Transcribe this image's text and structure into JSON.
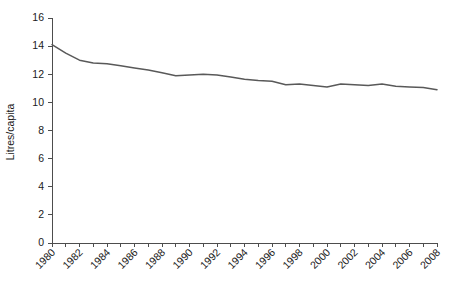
{
  "chart_data": {
    "type": "line",
    "title": "",
    "xlabel": "",
    "ylabel": "Litres/capita",
    "ylim": [
      0,
      16
    ],
    "yticks": [
      0,
      2,
      4,
      6,
      8,
      10,
      12,
      14,
      16
    ],
    "ytick_labels": [
      "0",
      "2",
      "4",
      "6",
      "8",
      "10",
      "12",
      "14",
      "16"
    ],
    "xlim": [
      1980,
      2008
    ],
    "xticks": [
      1980,
      1981,
      1982,
      1983,
      1984,
      1985,
      1986,
      1987,
      1988,
      1989,
      1990,
      1991,
      1992,
      1993,
      1994,
      1995,
      1996,
      1997,
      1998,
      1999,
      2000,
      2001,
      2002,
      2003,
      2004,
      2005,
      2006,
      2007,
      2008
    ],
    "xtick_labels": [
      "1980",
      "",
      "1982",
      "",
      "1984",
      "",
      "1986",
      "",
      "1988",
      "",
      "1990",
      "",
      "1992",
      "",
      "1994",
      "",
      "1996",
      "",
      "1998",
      "",
      "2000",
      "",
      "2002",
      "",
      "2004",
      "",
      "2006",
      "",
      "2008"
    ],
    "xtick_labels_shown": [
      "1980",
      "1982",
      "1984",
      "1986",
      "1988",
      "1990",
      "1992",
      "1994",
      "1996",
      "1998",
      "2000",
      "2002",
      "2004",
      "2006",
      "2008"
    ],
    "xtick_label_rotation": 45,
    "grid": false,
    "legend": false,
    "legend_position": "none",
    "line_color": "#595959",
    "x": [
      1980,
      1981,
      1982,
      1983,
      1984,
      1985,
      1986,
      1987,
      1988,
      1989,
      1990,
      1991,
      1992,
      1993,
      1994,
      1995,
      1996,
      1997,
      1998,
      1999,
      2000,
      2001,
      2002,
      2003,
      2004,
      2005,
      2006,
      2007,
      2008
    ],
    "values": [
      14.1,
      13.5,
      13.0,
      12.8,
      12.75,
      12.6,
      12.45,
      12.3,
      12.1,
      11.9,
      11.95,
      12.0,
      11.95,
      11.8,
      11.65,
      11.55,
      11.5,
      11.25,
      11.3,
      11.2,
      11.1,
      11.3,
      11.25,
      11.2,
      11.3,
      11.15,
      11.1,
      11.05,
      10.9
    ],
    "series": [
      {
        "name": "Litres/capita",
        "values": [
          14.1,
          13.5,
          13.0,
          12.8,
          12.75,
          12.6,
          12.45,
          12.3,
          12.1,
          11.9,
          11.95,
          12.0,
          11.95,
          11.8,
          11.65,
          11.55,
          11.5,
          11.25,
          11.3,
          11.2,
          11.1,
          11.3,
          11.25,
          11.2,
          11.3,
          11.15,
          11.1,
          11.05,
          10.9
        ]
      }
    ]
  },
  "axes": {
    "y_title": "Litres/capita"
  }
}
